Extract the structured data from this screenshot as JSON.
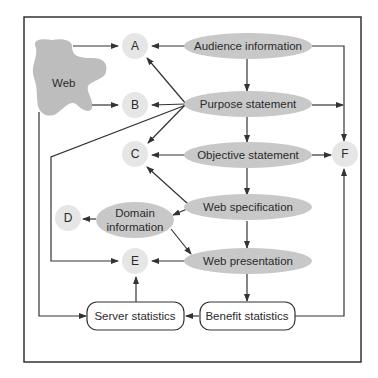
{
  "diagram": {
    "web_blob": {
      "label": "Web"
    },
    "circles": {
      "A": "A",
      "B": "B",
      "C": "C",
      "D": "D",
      "E": "E",
      "F": "F"
    },
    "ovals": {
      "audience": "Audience information",
      "purpose": "Purpose statement",
      "objective": "Objective statement",
      "specification": "Web specification",
      "presentation": "Web presentation",
      "domain_line1": "Domain",
      "domain_line2": "information"
    },
    "boxes": {
      "server": "Server statistics",
      "benefit": "Benefit statistics"
    },
    "colors": {
      "oval_fill": "#c8c8c8",
      "circle_fill": "#e6e6e6",
      "blob_fill": "#bdbdbd",
      "line": "#333333"
    }
  }
}
